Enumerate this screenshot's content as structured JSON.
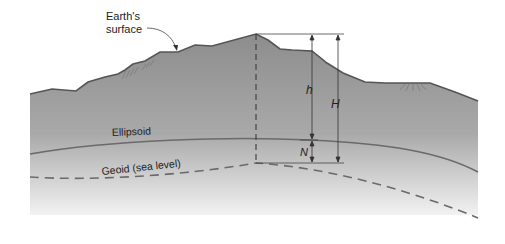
{
  "figure": {
    "labels": {
      "earth_surface_line1": "Earth's",
      "earth_surface_line2": "surface",
      "ellipsoid": "Ellipsoid",
      "geoid": "Geoid (sea level)",
      "h": "h",
      "H": "H",
      "N": "N"
    },
    "colors": {
      "terrain_top": "#8f8f8f",
      "terrain_bottom": "#f0f0f0",
      "surface_line": "#555555",
      "ellipsoid_line": "#6a6a6a",
      "geoid_line": "#6a6a6a",
      "dimension_line": "#333333"
    },
    "relations": "h = H + N"
  }
}
